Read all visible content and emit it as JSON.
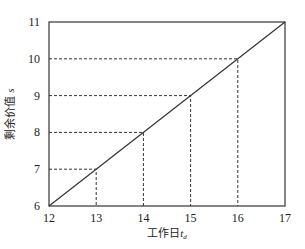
{
  "chart_data": {
    "type": "line",
    "title": "",
    "xlabel": "工作日",
    "xlabel_sub": "d",
    "xlabel_var": "t",
    "ylabel": "剩余价值",
    "ylabel_var": "s",
    "xlim": [
      12,
      17
    ],
    "ylim": [
      6,
      11
    ],
    "x_ticks": [
      12,
      13,
      14,
      15,
      16,
      17
    ],
    "y_ticks": [
      6,
      7,
      8,
      9,
      10,
      11
    ],
    "grid": false,
    "legend": null,
    "series": [
      {
        "name": "剩余价值",
        "x": [
          12,
          17
        ],
        "y": [
          6,
          11
        ],
        "style": "solid"
      }
    ],
    "guide_points": [
      {
        "x": 13,
        "y": 7
      },
      {
        "x": 14,
        "y": 8
      },
      {
        "x": 15,
        "y": 9
      },
      {
        "x": 16,
        "y": 10
      }
    ],
    "guide_style": "dashed"
  },
  "colors": {
    "line": "#333333",
    "frame": "#333333",
    "guide": "#333333"
  }
}
